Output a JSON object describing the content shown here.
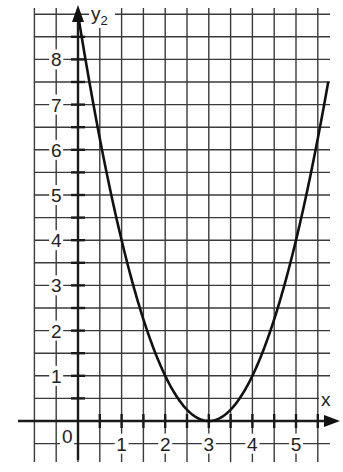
{
  "chart_data": {
    "type": "line",
    "title": "",
    "xlabel": "x",
    "ylabel": "y2",
    "ylabel_main": "y",
    "ylabel_sub": "2",
    "origin_label": "0",
    "x_ticks": [
      "1",
      "2",
      "3",
      "4",
      "5"
    ],
    "y_ticks": [
      "1",
      "2",
      "3",
      "4",
      "5",
      "6",
      "7",
      "8"
    ],
    "xlim": [
      -1,
      5.75
    ],
    "ylim": [
      -0.5,
      9
    ],
    "grid": true,
    "grid_step": 0.5,
    "legend": null,
    "series": [
      {
        "name": "y2 = (x - 3)^2",
        "x": [
          0,
          0.5,
          1,
          1.5,
          2,
          2.5,
          3,
          3.5,
          4,
          4.5,
          5,
          5.5,
          5.74
        ],
        "values": [
          9,
          6.25,
          4,
          2.25,
          1,
          0.25,
          0,
          0.25,
          1,
          2.25,
          4,
          6.25,
          7.5
        ]
      }
    ],
    "colors": {
      "curve": "#111111",
      "grid": "#3a3a3a",
      "background": "#ffffff"
    }
  }
}
